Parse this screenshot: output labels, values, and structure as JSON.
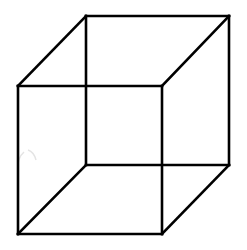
{
  "figure": {
    "title": "Necker cube",
    "type": "wireframe-cube",
    "stroke_color": "#000000",
    "background_color": "#ffffff",
    "front_face": {
      "top_left": [
        18,
        86
      ],
      "top_right": [
        162,
        86
      ],
      "bottom_right": [
        162,
        234
      ],
      "bottom_left": [
        18,
        234
      ]
    },
    "back_face": {
      "top_left": [
        86,
        16
      ],
      "top_right": [
        229,
        16
      ],
      "bottom_right": [
        229,
        165
      ],
      "bottom_left": [
        86,
        165
      ]
    },
    "edges_count": 12
  }
}
